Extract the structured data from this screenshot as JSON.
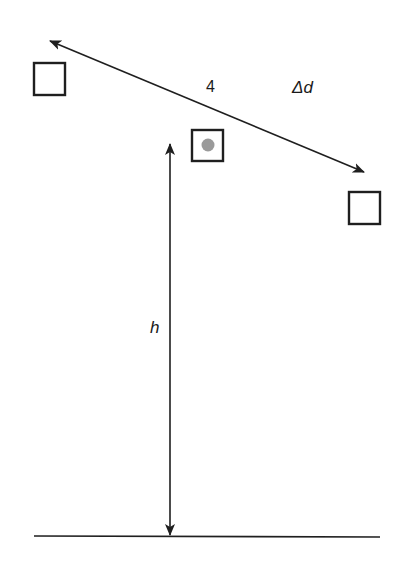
{
  "diagram": {
    "labels": {
      "count": "4",
      "delta_prefix": "Δ",
      "delta_var": "d",
      "height": "h"
    },
    "colors": {
      "stroke": "#1f1f1f",
      "dot": "#9a9a9a",
      "background": "#ffffff"
    },
    "elements": {
      "squares": [
        {
          "id": "left",
          "x": 34,
          "y": 63,
          "size": 31,
          "has_dot": false
        },
        {
          "id": "center",
          "x": 192,
          "y": 130,
          "size": 31,
          "has_dot": true
        },
        {
          "id": "right",
          "x": 349,
          "y": 192,
          "size": 31,
          "has_dot": false
        }
      ],
      "displacement_arrow": {
        "from": [
          50,
          41
        ],
        "to": [
          364,
          172
        ],
        "double_headed": true
      },
      "height_arrow": {
        "x": 170,
        "top": 144,
        "bottom": 535,
        "double_headed": true
      },
      "ground_line": {
        "y": 536,
        "x1": 34,
        "x2": 380
      }
    }
  }
}
